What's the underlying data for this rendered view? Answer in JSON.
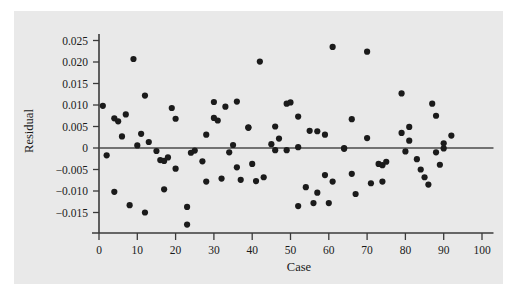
{
  "chart_data": {
    "type": "scatter",
    "title": "",
    "xlabel": "Case",
    "ylabel": "Residual",
    "xlim": [
      0,
      103
    ],
    "ylim": [
      -0.0185,
      0.0265
    ],
    "grid": false,
    "legend": null,
    "reference_line": {
      "orientation": "horizontal",
      "y": 0.0
    },
    "x_ticks": [
      0,
      10,
      20,
      30,
      40,
      50,
      60,
      70,
      80,
      90,
      100
    ],
    "x_tick_labels": [
      "0",
      "10",
      "20",
      "30",
      "40",
      "50",
      "60",
      "70",
      "80",
      "90",
      "100"
    ],
    "y_ticks": [
      0.025,
      0.02,
      0.015,
      0.01,
      0.005,
      0,
      -0.005,
      -0.01,
      -0.015
    ],
    "y_tick_labels": [
      "0.025",
      "0.020",
      "0.015",
      "0.010",
      "0.005",
      "0",
      "−0.005",
      "−0.010",
      "−0.015"
    ],
    "marker": {
      "shape": "circle",
      "color": "#1b1b1b",
      "size": 3.1
    },
    "point_count": 94,
    "points": [
      {
        "x": 1,
        "y": 0.0098
      },
      {
        "x": 2,
        "y": -0.0017
      },
      {
        "x": 4,
        "y": 0.0069
      },
      {
        "x": 4,
        "y": -0.0102
      },
      {
        "x": 5,
        "y": 0.0062
      },
      {
        "x": 6,
        "y": 0.0027
      },
      {
        "x": 7,
        "y": 0.0078
      },
      {
        "x": 8,
        "y": -0.0133
      },
      {
        "x": 9,
        "y": 0.0207
      },
      {
        "x": 10,
        "y": 0.0006
      },
      {
        "x": 11,
        "y": 0.0033
      },
      {
        "x": 12,
        "y": 0.0122
      },
      {
        "x": 12,
        "y": -0.015
      },
      {
        "x": 13,
        "y": 0.0014
      },
      {
        "x": 15,
        "y": -0.0007
      },
      {
        "x": 16,
        "y": -0.0028
      },
      {
        "x": 17,
        "y": -0.003
      },
      {
        "x": 17,
        "y": -0.0096
      },
      {
        "x": 18,
        "y": -0.0022
      },
      {
        "x": 19,
        "y": 0.0093
      },
      {
        "x": 20,
        "y": 0.0068
      },
      {
        "x": 20,
        "y": -0.0048
      },
      {
        "x": 23,
        "y": -0.0137
      },
      {
        "x": 23,
        "y": -0.0178
      },
      {
        "x": 24,
        "y": -0.0011
      },
      {
        "x": 25,
        "y": -0.0006
      },
      {
        "x": 27,
        "y": -0.0031
      },
      {
        "x": 28,
        "y": 0.0031
      },
      {
        "x": 28,
        "y": -0.0078
      },
      {
        "x": 30,
        "y": 0.0107
      },
      {
        "x": 30,
        "y": 0.007
      },
      {
        "x": 31,
        "y": 0.0064
      },
      {
        "x": 32,
        "y": -0.0071
      },
      {
        "x": 33,
        "y": 0.0096
      },
      {
        "x": 34,
        "y": -0.001
      },
      {
        "x": 35,
        "y": 0.0007
      },
      {
        "x": 36,
        "y": 0.0108
      },
      {
        "x": 36,
        "y": -0.0045
      },
      {
        "x": 37,
        "y": -0.0074
      },
      {
        "x": 39,
        "y": 0.0048
      },
      {
        "x": 39,
        "y": 0.0047
      },
      {
        "x": 40,
        "y": -0.0037
      },
      {
        "x": 41,
        "y": -0.0077
      },
      {
        "x": 42,
        "y": 0.0201
      },
      {
        "x": 43,
        "y": -0.0068
      },
      {
        "x": 45,
        "y": 0.0009
      },
      {
        "x": 46,
        "y": 0.005
      },
      {
        "x": 46,
        "y": -0.0005
      },
      {
        "x": 47,
        "y": 0.0022
      },
      {
        "x": 49,
        "y": -0.0005
      },
      {
        "x": 49,
        "y": 0.0103
      },
      {
        "x": 50,
        "y": 0.0106
      },
      {
        "x": 52,
        "y": 0.0073
      },
      {
        "x": 52,
        "y": 0.0002
      },
      {
        "x": 52,
        "y": -0.0135
      },
      {
        "x": 54,
        "y": -0.0091
      },
      {
        "x": 55,
        "y": 0.004
      },
      {
        "x": 56,
        "y": -0.0128
      },
      {
        "x": 57,
        "y": 0.0039
      },
      {
        "x": 57,
        "y": -0.0104
      },
      {
        "x": 59,
        "y": 0.0031
      },
      {
        "x": 59,
        "y": -0.0063
      },
      {
        "x": 60,
        "y": -0.0128
      },
      {
        "x": 61,
        "y": 0.0235
      },
      {
        "x": 61,
        "y": -0.0078
      },
      {
        "x": 64,
        "y": 0.0
      },
      {
        "x": 64,
        "y": -0.0002
      },
      {
        "x": 66,
        "y": 0.0067
      },
      {
        "x": 66,
        "y": -0.006
      },
      {
        "x": 67,
        "y": -0.0107
      },
      {
        "x": 70,
        "y": 0.0023
      },
      {
        "x": 70,
        "y": 0.0224
      },
      {
        "x": 71,
        "y": -0.0082
      },
      {
        "x": 73,
        "y": -0.0037
      },
      {
        "x": 74,
        "y": -0.004
      },
      {
        "x": 74,
        "y": -0.0078
      },
      {
        "x": 75,
        "y": -0.0032
      },
      {
        "x": 79,
        "y": 0.0035
      },
      {
        "x": 79,
        "y": 0.0127
      },
      {
        "x": 80,
        "y": -0.0008
      },
      {
        "x": 81,
        "y": 0.0049
      },
      {
        "x": 81,
        "y": 0.0017
      },
      {
        "x": 83,
        "y": -0.0026
      },
      {
        "x": 84,
        "y": -0.005
      },
      {
        "x": 85,
        "y": -0.0068
      },
      {
        "x": 86,
        "y": -0.0085
      },
      {
        "x": 87,
        "y": 0.0103
      },
      {
        "x": 88,
        "y": 0.0075
      },
      {
        "x": 88,
        "y": -0.001
      },
      {
        "x": 89,
        "y": -0.0039
      },
      {
        "x": 90,
        "y": 0.0011
      },
      {
        "x": 90,
        "y": -0.0001
      },
      {
        "x": 92,
        "y": 0.0029
      }
    ]
  },
  "axes": {
    "x_title": "Case",
    "y_title": "Residual"
  },
  "colors": {
    "background": "#ffffff",
    "panel": "#e9e9e9",
    "axis": "#3a3a3a",
    "marker": "#1b1b1b",
    "zero_line": "#4a4a4a"
  }
}
